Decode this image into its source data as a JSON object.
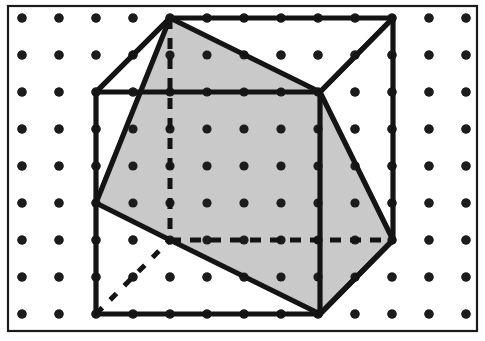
{
  "figure": {
    "caption": "",
    "canvas": {
      "width": 485,
      "height": 341
    },
    "colors": {
      "background": "#ffffff",
      "ink": "#141414",
      "frame": "#1a1a1a",
      "dot": "#1c1c1c",
      "section_fill": "#c9c9c9"
    },
    "frame": {
      "x": 8,
      "y": 6,
      "width": 469,
      "height": 325
    },
    "grid": {
      "label": "isometric dot lattice",
      "columns": 13,
      "rows": 9,
      "origin_x": 22,
      "origin_y": 18,
      "spacing_x": 37,
      "spacing_y": 37,
      "dot_radius": 4.6
    },
    "cube": {
      "label": "cube in oblique projection",
      "vertices": {
        "front_top_left": [
          96,
          92
        ],
        "front_top_right": [
          320,
          92
        ],
        "front_bottom_left": [
          96,
          314
        ],
        "front_bottom_right": [
          320,
          314
        ],
        "back_top_left": [
          170,
          18
        ],
        "back_top_right": [
          393,
          18
        ],
        "back_bottom_left": [
          170,
          240
        ],
        "back_bottom_right": [
          393,
          240
        ]
      },
      "visible_edges": [
        [
          "front_top_left",
          "front_top_right"
        ],
        [
          "front_top_right",
          "front_bottom_right"
        ],
        [
          "front_bottom_right",
          "front_bottom_left"
        ],
        [
          "front_bottom_left",
          "front_top_left"
        ],
        [
          "back_top_left",
          "back_top_right"
        ],
        [
          "back_top_right",
          "back_bottom_right"
        ],
        [
          "front_top_left",
          "back_top_left"
        ],
        [
          "front_top_right",
          "back_top_right"
        ],
        [
          "front_bottom_right",
          "back_bottom_right"
        ]
      ],
      "hidden_edges": [
        [
          "back_top_left",
          "back_bottom_left"
        ],
        [
          "back_bottom_left",
          "back_bottom_right"
        ]
      ]
    },
    "cross_section": {
      "label": "shaded hexagonal section plane",
      "polygon": [
        [
          170,
          18
        ],
        [
          320,
          92
        ],
        [
          393,
          240
        ],
        [
          320,
          314
        ],
        [
          170,
          240
        ],
        [
          96,
          203
        ]
      ],
      "fill": "#c9c9c9"
    },
    "extra_lines": {
      "label": "auxiliary construction lines",
      "dashed_diagonal": [
        [
          96,
          314
        ],
        [
          170,
          240
        ]
      ],
      "corner_chords": [
        [
          [
            170,
            18
          ],
          [
            96,
            92
          ]
        ],
        [
          [
            320,
            92
          ],
          [
            393,
            18
          ]
        ],
        [
          [
            320,
            314
          ],
          [
            393,
            240
          ]
        ]
      ]
    }
  }
}
